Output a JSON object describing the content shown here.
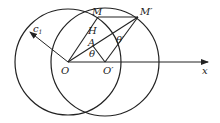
{
  "diagram": {
    "colors": {
      "stroke": "#222222",
      "background": "#ffffff"
    },
    "points": {
      "O": {
        "label": "O",
        "x": 68,
        "y": 62
      },
      "O_prime": {
        "label": "O′",
        "x": 105,
        "y": 62
      },
      "M": {
        "label": "M",
        "x": 98,
        "y": 17
      },
      "M_prime": {
        "label": "M′",
        "x": 138,
        "y": 17
      },
      "H": {
        "label": "H",
        "x": 92,
        "y": 30
      },
      "A": {
        "label": "A",
        "x": 93,
        "y": 46
      }
    },
    "circles": [
      {
        "name": "left-circle",
        "cx": 68,
        "cy": 62,
        "r": 53
      },
      {
        "name": "right-circle",
        "cx": 105,
        "cy": 62,
        "r": 54
      }
    ],
    "labels": {
      "O": "O",
      "O_prime": "O′",
      "M": "M",
      "M_prime": "M′",
      "H": "H",
      "A": "A",
      "theta": "θ",
      "theta_prime": "θ′",
      "x_axis": "x",
      "c1_main": "c",
      "c1_sub": "1"
    }
  }
}
